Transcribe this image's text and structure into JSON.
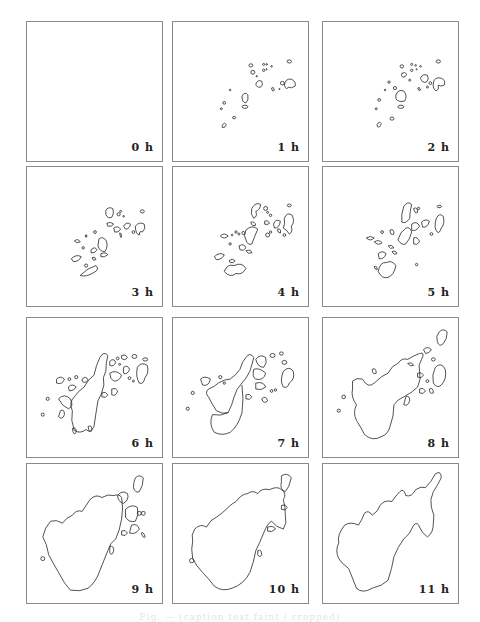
{
  "figure": {
    "panels": [
      {
        "label": "0 h"
      },
      {
        "label": "1 h"
      },
      {
        "label": "2 h"
      },
      {
        "label": "3 h"
      },
      {
        "label": "4 h"
      },
      {
        "label": "5 h"
      },
      {
        "label": "6 h"
      },
      {
        "label": "7 h"
      },
      {
        "label": "8 h"
      },
      {
        "label": "9 h"
      },
      {
        "label": "10 h"
      },
      {
        "label": "11 h"
      }
    ],
    "caption": "Fig. — (caption text faint / cropped)",
    "line_color": "#222222",
    "border_color": "#8a8a8a"
  }
}
